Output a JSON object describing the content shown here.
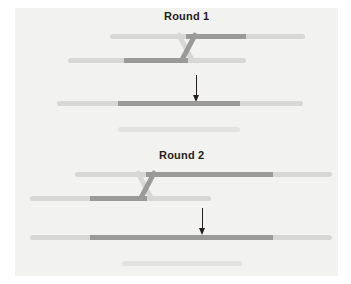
{
  "figure": {
    "title_round1": "Round 1",
    "title_round2": "Round 2",
    "arrow1_name": "down-arrow-icon",
    "arrow2_name": "down-arrow-icon",
    "colors": {
      "background": "#ffffff",
      "panel": "#f2f2f0",
      "light_strand": "#d7d8d6",
      "pale_strand": "#e2e3e1",
      "dark_strand": "#9a9a98",
      "mid_strand": "#b5b6b4",
      "text": "#231f20",
      "arrow": "#231f20"
    },
    "rounds": [
      {
        "label": "Round 1",
        "parents": [
          {
            "name": "round1-parent-strand-top",
            "segments": [
              {
                "color_role": "light",
                "from": 110,
                "to": 186
              },
              {
                "color_role": "dark",
                "from": 186,
                "to": 246
              },
              {
                "color_role": "light",
                "from": 246,
                "to": 305
              }
            ]
          },
          {
            "name": "round1-parent-strand-bottom",
            "segments": [
              {
                "color_role": "light",
                "from": 68,
                "to": 124
              },
              {
                "color_role": "dark",
                "from": 124,
                "to": 188
              },
              {
                "color_role": "light",
                "from": 188,
                "to": 246
              }
            ]
          }
        ],
        "crossover": {
          "name": "round1-crossover-x",
          "center_x": 187
        },
        "arrow": {
          "name": "round1-arrow",
          "x": 196,
          "top": 75,
          "height": 27
        },
        "products": [
          {
            "name": "round1-product-strand-recombinant",
            "segments": [
              {
                "color_role": "light",
                "from": 57,
                "to": 118
              },
              {
                "color_role": "dark",
                "from": 118,
                "to": 240
              },
              {
                "color_role": "light",
                "from": 240,
                "to": 303
              }
            ]
          },
          {
            "name": "round1-product-strand-parental",
            "segments": [
              {
                "color_role": "pale",
                "from": 118,
                "to": 240
              }
            ]
          }
        ]
      },
      {
        "label": "Round 2",
        "parents": [
          {
            "name": "round2-parent-strand-top",
            "segments": [
              {
                "color_role": "light",
                "from": 75,
                "to": 146
              },
              {
                "color_role": "dark",
                "from": 146,
                "to": 273
              },
              {
                "color_role": "light",
                "from": 273,
                "to": 332
              }
            ]
          },
          {
            "name": "round2-parent-strand-bottom",
            "segments": [
              {
                "color_role": "light",
                "from": 30,
                "to": 90
              },
              {
                "color_role": "dark",
                "from": 90,
                "to": 147
              },
              {
                "color_role": "light",
                "from": 147,
                "to": 211
              }
            ]
          }
        ],
        "crossover": {
          "name": "round2-crossover-x",
          "center_x": 146
        },
        "arrow": {
          "name": "round2-arrow",
          "x": 202,
          "top": 208,
          "height": 27
        },
        "products": [
          {
            "name": "round2-product-strand-recombinant",
            "segments": [
              {
                "color_role": "light",
                "from": 30,
                "to": 90
              },
              {
                "color_role": "dark",
                "from": 90,
                "to": 273
              },
              {
                "color_role": "light",
                "from": 273,
                "to": 332
              }
            ]
          },
          {
            "name": "round2-product-strand-parental",
            "segments": [
              {
                "color_role": "pale",
                "from": 122,
                "to": 242
              }
            ]
          }
        ]
      }
    ]
  }
}
